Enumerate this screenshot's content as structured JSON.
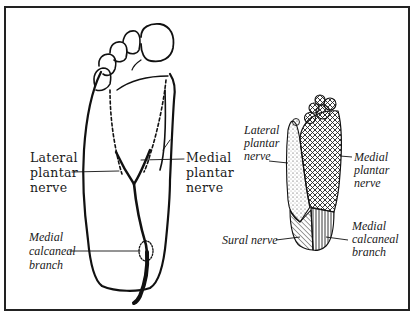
{
  "figure": {
    "left_diagram": {
      "description": "Plantar view of foot showing nerve courses",
      "labels": {
        "lateral_plantar_nerve": [
          "Lateral",
          "plantar",
          "nerve"
        ],
        "medial_plantar_nerve": [
          "Medial",
          "plantar",
          "nerve"
        ],
        "medial_calcaneal_branch": [
          "Medial",
          "calcaneal",
          "branch"
        ]
      }
    },
    "right_diagram": {
      "description": "Sensory distribution map of plantar foot",
      "labels": {
        "lateral_plantar_nerve": [
          "Lateral",
          "plantar",
          "nerve"
        ],
        "medial_plantar_nerve": [
          "Medial",
          "plantar",
          "nerve"
        ],
        "sural_nerve": [
          "Sural nerve"
        ],
        "medial_calcaneal_branch": [
          "Medial",
          "calcaneal",
          "branch"
        ]
      },
      "regions": [
        {
          "nerve": "Lateral plantar nerve",
          "pattern": "stipple"
        },
        {
          "nerve": "Medial plantar nerve",
          "pattern": "crosshatch"
        },
        {
          "nerve": "Sural nerve",
          "pattern": "diagonal-hatch"
        },
        {
          "nerve": "Medial calcaneal branch",
          "pattern": "vertical-lines"
        }
      ]
    }
  }
}
